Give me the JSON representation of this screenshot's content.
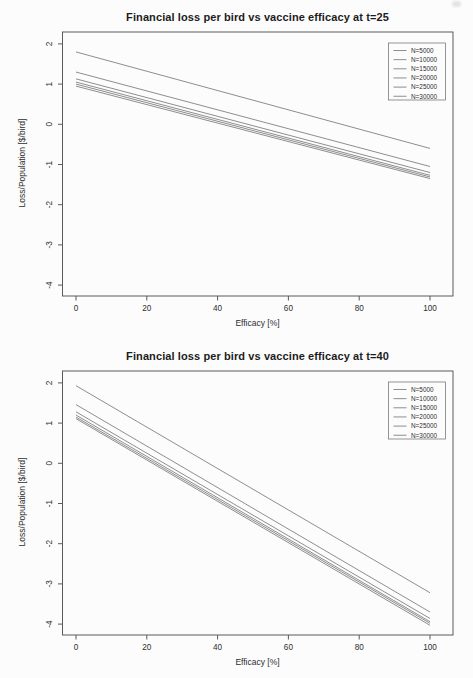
{
  "page": {
    "background_color": "#fcfcfc",
    "axis_color": "#5a5a5a",
    "text_color": "#2e2e2e"
  },
  "chart_data": [
    {
      "type": "line",
      "title": "Financial loss per bird vs vaccine efficacy at t=25",
      "xlabel": "Efficacy [%]",
      "ylabel": "Loss/Population [$/bird]",
      "xlim": [
        0,
        100
      ],
      "ylim": [
        -4,
        2
      ],
      "x_ticks": [
        0,
        20,
        40,
        60,
        80,
        100
      ],
      "y_ticks": [
        2,
        1,
        0,
        -1,
        -2,
        -3,
        -4
      ],
      "grid": false,
      "legend_position": "top-right",
      "line_color": "#8e8e8e",
      "x": [
        0,
        100
      ],
      "series": [
        {
          "name": "N=5000",
          "values": [
            1.8,
            -0.6
          ]
        },
        {
          "name": "N=10000",
          "values": [
            1.3,
            -1.05
          ]
        },
        {
          "name": "N=15000",
          "values": [
            1.13,
            -1.2
          ]
        },
        {
          "name": "N=20000",
          "values": [
            1.05,
            -1.27
          ]
        },
        {
          "name": "N=25000",
          "values": [
            1.0,
            -1.31
          ]
        },
        {
          "name": "N=30000",
          "values": [
            0.95,
            -1.35
          ]
        }
      ]
    },
    {
      "type": "line",
      "title": "Financial loss per bird vs vaccine efficacy at t=40",
      "xlabel": "Efficacy [%]",
      "ylabel": "Loss/Population [$/bird]",
      "xlim": [
        0,
        100
      ],
      "ylim": [
        -4,
        2
      ],
      "x_ticks": [
        0,
        20,
        40,
        60,
        80,
        100
      ],
      "y_ticks": [
        2,
        1,
        0,
        -1,
        -2,
        -3,
        -4
      ],
      "grid": false,
      "legend_position": "top-right",
      "line_color": "#8e8e8e",
      "x": [
        0,
        100
      ],
      "series": [
        {
          "name": "N=5000",
          "values": [
            1.93,
            -3.22
          ]
        },
        {
          "name": "N=10000",
          "values": [
            1.46,
            -3.7
          ]
        },
        {
          "name": "N=15000",
          "values": [
            1.28,
            -3.86
          ]
        },
        {
          "name": "N=20000",
          "values": [
            1.2,
            -3.94
          ]
        },
        {
          "name": "N=25000",
          "values": [
            1.15,
            -3.98
          ]
        },
        {
          "name": "N=30000",
          "values": [
            1.11,
            -4.03
          ]
        }
      ]
    }
  ]
}
